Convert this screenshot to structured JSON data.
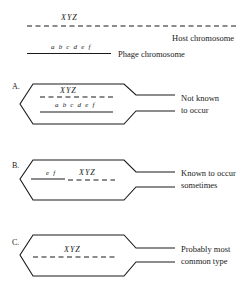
{
  "legend": {
    "host_genes": "XYZ",
    "host_label": "Host chromosome",
    "phage_genes": "a b c d e f",
    "phage_label": "Phage chromosome"
  },
  "panels": [
    {
      "letter": "A.",
      "top_genes": "XYZ",
      "bottom_genes": "a b c d e f",
      "caption_line1": "Not known",
      "caption_line2": "to occur"
    },
    {
      "letter": "B.",
      "phage_genes": "e f",
      "host_genes": "XYZ",
      "caption_line1": "Known to occur",
      "caption_line2": "sometimes"
    },
    {
      "letter": "C.",
      "host_genes": "XYZ",
      "caption_line1": "Probably most",
      "caption_line2": "common type"
    }
  ],
  "colors": {
    "ink": "#1a1a1a",
    "background": "#ffffff"
  }
}
